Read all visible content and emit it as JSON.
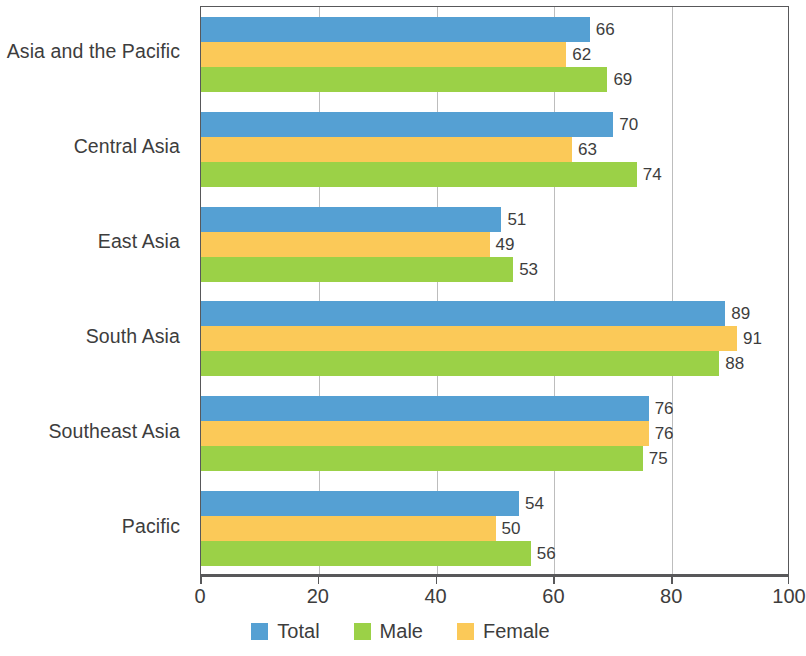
{
  "chart_data": {
    "type": "bar",
    "orientation": "horizontal",
    "title": "",
    "subtitle": "",
    "xlabel": "",
    "ylabel": "",
    "xlim": [
      0,
      100
    ],
    "xticks": [
      "0",
      "20",
      "40",
      "60",
      "80",
      "100"
    ],
    "grid": true,
    "legend_position": "bottom",
    "categories": [
      "Asia and the Pacific",
      "Central Asia",
      "East Asia",
      "South Asia",
      "Southeast Asia",
      "Pacific"
    ],
    "series": [
      {
        "name": "Total",
        "color": "#55a0d3",
        "values": [
          66,
          70,
          51,
          89,
          76,
          54
        ]
      },
      {
        "name": "Female",
        "color": "#fbc958",
        "values": [
          62,
          63,
          49,
          91,
          76,
          50
        ]
      },
      {
        "name": "Male",
        "color": "#9bd147",
        "values": [
          69,
          74,
          53,
          88,
          75,
          56
        ]
      }
    ],
    "series_draw_order": [
      "Total",
      "Female",
      "Male"
    ],
    "legend_order": [
      "Total",
      "Male",
      "Female"
    ]
  },
  "legend": {
    "items": [
      {
        "label": "Total",
        "color": "#55a0d3",
        "swatch": "legend-swatch-total"
      },
      {
        "label": "Male",
        "color": "#9bd147",
        "swatch": "legend-swatch-male"
      },
      {
        "label": "Female",
        "color": "#fbc958",
        "swatch": "legend-swatch-female"
      }
    ]
  },
  "axis": {
    "x_ticks": [
      "0",
      "20",
      "40",
      "60",
      "80",
      "100"
    ]
  }
}
